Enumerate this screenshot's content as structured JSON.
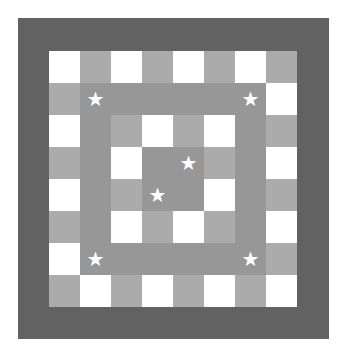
{
  "board": {
    "rows": 8,
    "cols": 8,
    "cells": [
      [
        "W",
        "L",
        "W",
        "L",
        "W",
        "L",
        "W",
        "L"
      ],
      [
        "L",
        "M",
        "M",
        "M",
        "M",
        "M",
        "M",
        "W"
      ],
      [
        "W",
        "M",
        "L",
        "W",
        "L",
        "W",
        "M",
        "L"
      ],
      [
        "L",
        "M",
        "W",
        "M",
        "M",
        "L",
        "M",
        "W"
      ],
      [
        "W",
        "M",
        "L",
        "M",
        "M",
        "W",
        "M",
        "L"
      ],
      [
        "L",
        "M",
        "W",
        "L",
        "W",
        "L",
        "M",
        "W"
      ],
      [
        "W",
        "M",
        "M",
        "M",
        "M",
        "M",
        "M",
        "L"
      ],
      [
        "L",
        "W",
        "L",
        "W",
        "L",
        "W",
        "L",
        "W"
      ]
    ],
    "stars": [
      [
        1,
        1
      ],
      [
        1,
        6
      ],
      [
        3,
        4
      ],
      [
        4,
        3
      ],
      [
        6,
        1
      ],
      [
        6,
        6
      ]
    ],
    "star_glyph": "★",
    "colors": {
      "frame": "#626262",
      "white": "#ffffff",
      "light": "#ababab",
      "mid": "#979797",
      "star": "#ffffff"
    }
  }
}
